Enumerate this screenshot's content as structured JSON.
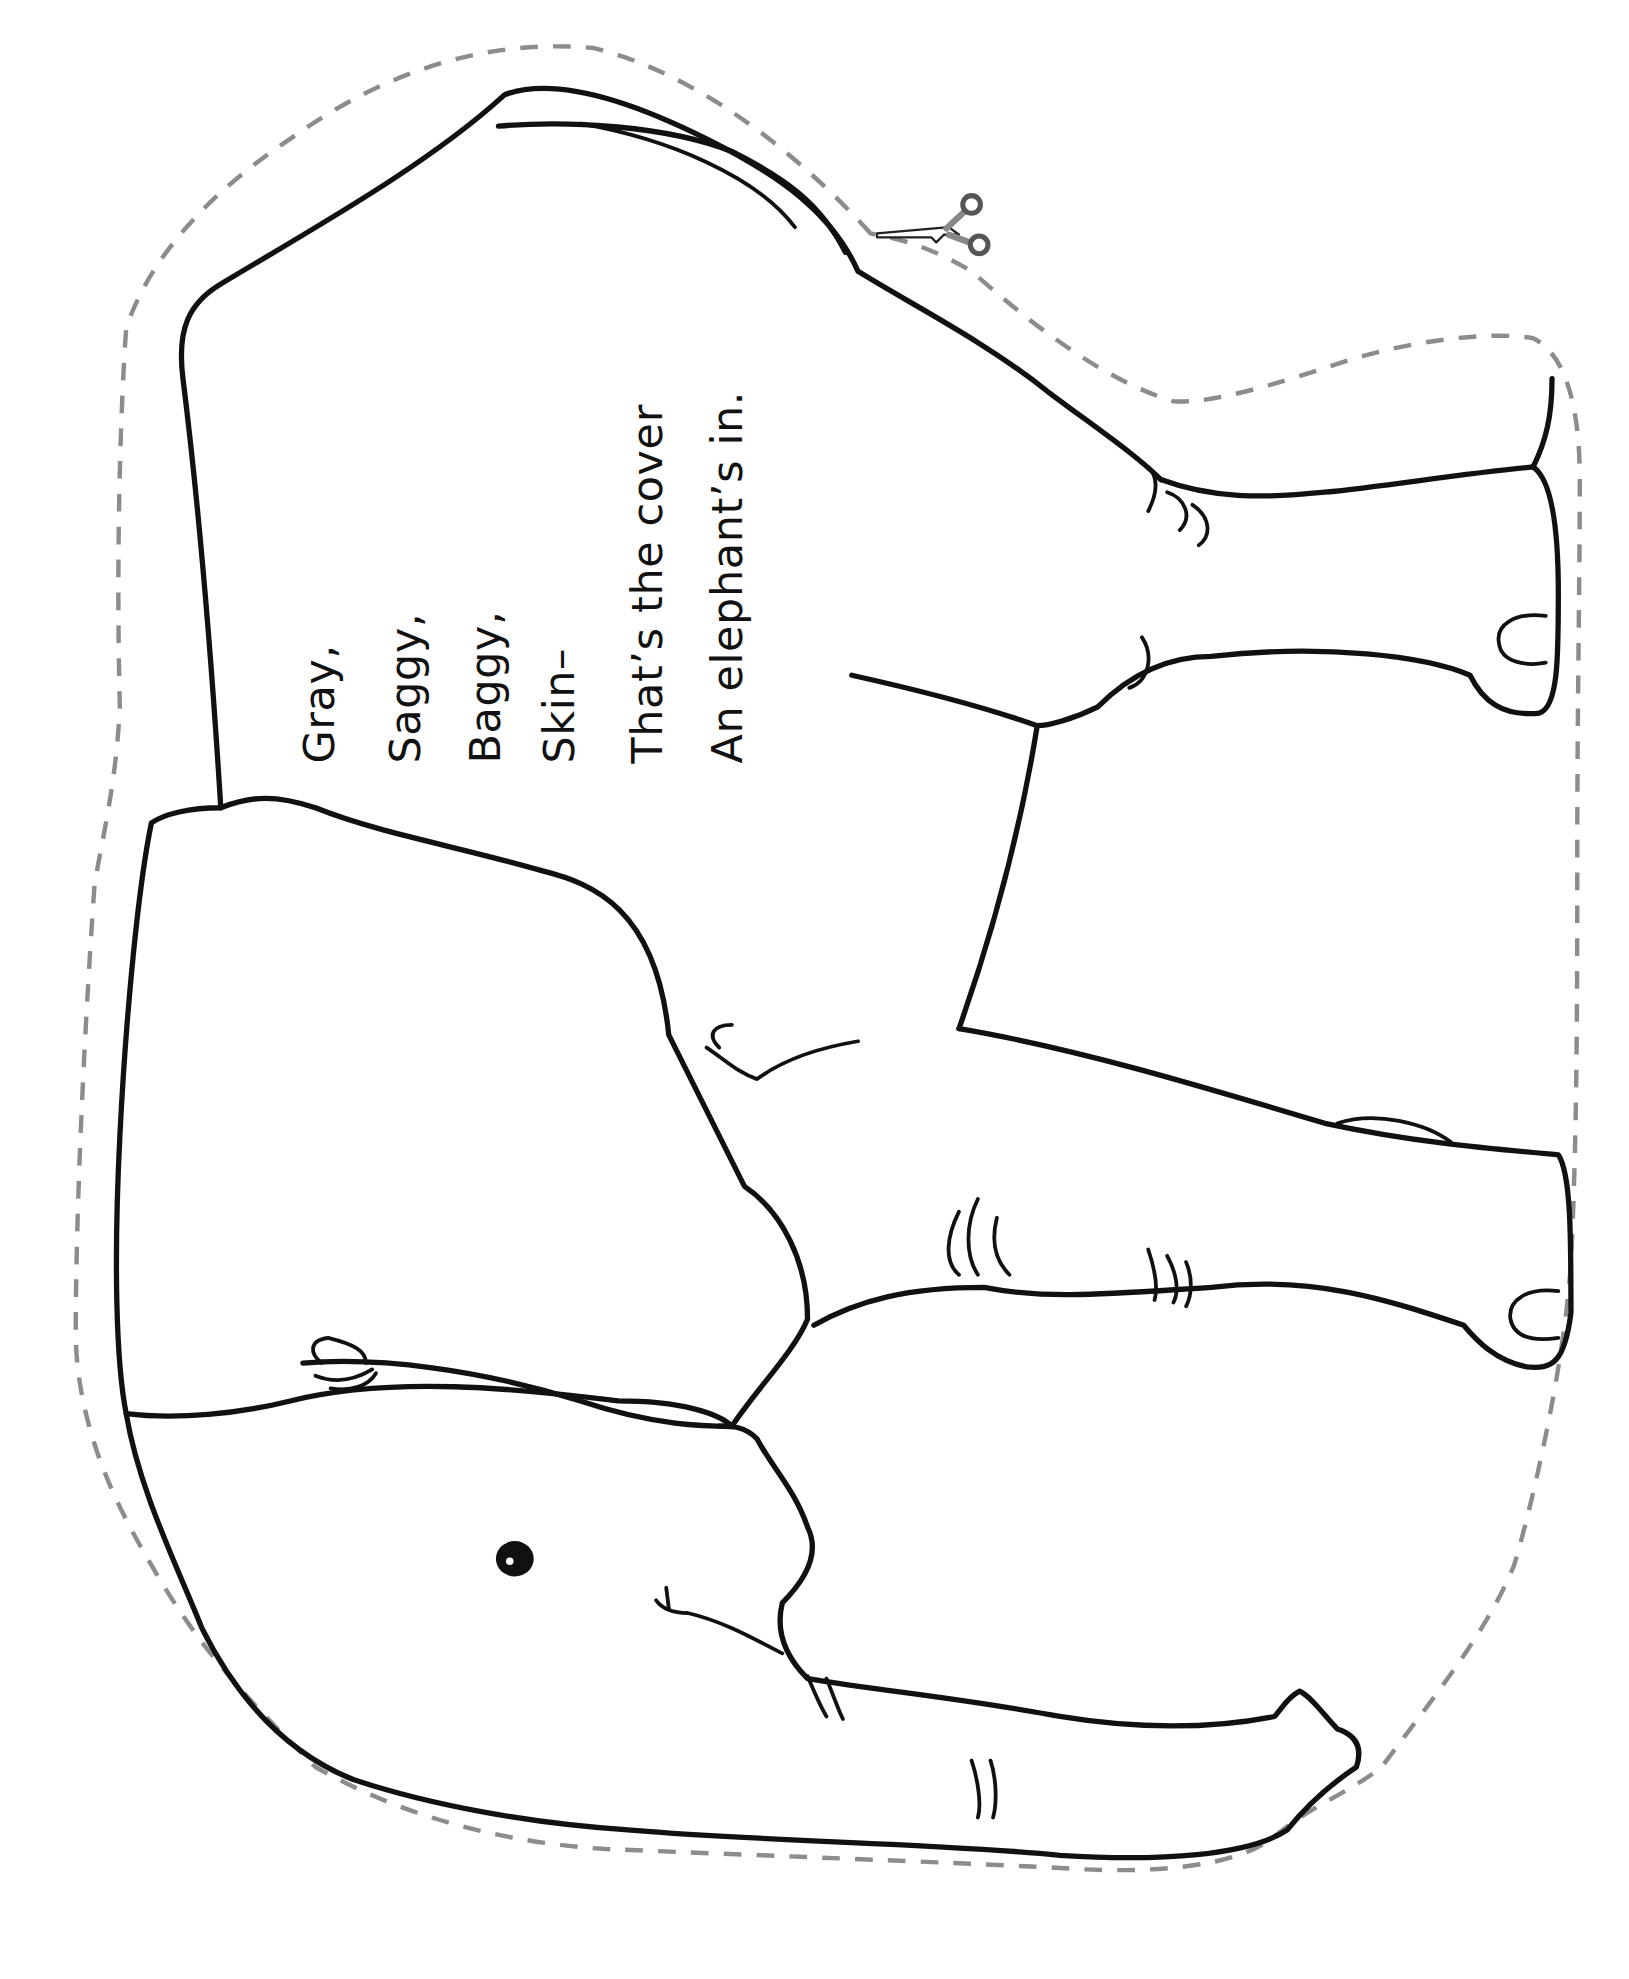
{
  "page": {
    "type": "cut-out coloring page",
    "orientation": "rotated 90° counter-clockwise",
    "background": "#ffffff"
  },
  "poem": {
    "lines": [
      "Gray,",
      "Saggy,",
      "Baggy,",
      "Skin–",
      "That’s the cover",
      "An elephant’s in."
    ]
  },
  "illustration": {
    "subject": "elephant",
    "line_color": "#111111",
    "cut_line_color": "#8c8c8c",
    "icons": [
      "scissors-icon"
    ]
  }
}
